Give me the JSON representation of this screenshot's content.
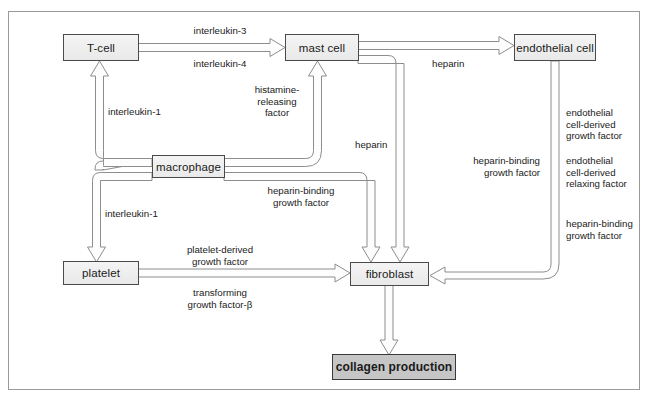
{
  "diagram": {
    "border_color": "#9a9a9a",
    "node_fill": "#eeeeee",
    "goal_fill": "#c6c6c6",
    "line_color": "#8a8a8a"
  },
  "nodes": [
    {
      "id": "tcell",
      "label": "T-cell"
    },
    {
      "id": "mastcell",
      "label": "mast cell"
    },
    {
      "id": "endothelial",
      "label": "endothelial cell"
    },
    {
      "id": "macrophage",
      "label": "macrophage"
    },
    {
      "id": "platelet",
      "label": "platelet"
    },
    {
      "id": "fibroblast",
      "label": "fibroblast"
    },
    {
      "id": "collagen",
      "label": "collagen production"
    }
  ],
  "edge_labels": [
    {
      "id": "il3",
      "text": "interleukin-3"
    },
    {
      "id": "il4",
      "text": "interleukin-4"
    },
    {
      "id": "il1a",
      "text": "interleukin-1"
    },
    {
      "id": "hrf",
      "text": "histamine-\nreleasing\nfactor"
    },
    {
      "id": "hep1",
      "text": "heparin"
    },
    {
      "id": "hep2",
      "text": "heparin"
    },
    {
      "id": "hbgf1",
      "text": "heparin-binding\ngrowth factor"
    },
    {
      "id": "il1b",
      "text": "interleukin-1"
    },
    {
      "id": "pdgf",
      "text": "platelet-derived\ngrowth factor"
    },
    {
      "id": "tgfb",
      "text": "transforming\ngrowth factor-β"
    },
    {
      "id": "hbgf2",
      "text": "heparin-binding\ngrowth factor"
    },
    {
      "id": "ecdgf",
      "text": "endothelial\ncell-derived\ngrowth factor"
    },
    {
      "id": "ecdrf",
      "text": "endothelial\ncell-derived\nrelaxing factor"
    },
    {
      "id": "hbgf3",
      "text": "heparin-binding\ngrowth factor"
    }
  ],
  "edges": [
    {
      "from": "tcell",
      "to": "mastcell",
      "labels": [
        "interleukin-3",
        "interleukin-4"
      ]
    },
    {
      "from": "mastcell",
      "to": "endothelial",
      "labels": [
        "heparin"
      ]
    },
    {
      "from": "macrophage",
      "to": "tcell",
      "labels": [
        "interleukin-1"
      ]
    },
    {
      "from": "macrophage",
      "to": "mastcell",
      "labels": [
        "histamine-releasing factor"
      ]
    },
    {
      "from": "macrophage",
      "to": "platelet",
      "labels": [
        "interleukin-1"
      ]
    },
    {
      "from": "macrophage",
      "to": "fibroblast",
      "labels": [
        "heparin-binding growth factor"
      ]
    },
    {
      "from": "mastcell",
      "to": "fibroblast",
      "labels": [
        "heparin"
      ]
    },
    {
      "from": "platelet",
      "to": "fibroblast",
      "labels": [
        "platelet-derived growth factor",
        "transforming growth factor-β"
      ]
    },
    {
      "from": "endothelial",
      "to": "fibroblast",
      "labels": [
        "heparin-binding growth factor",
        "endothelial cell-derived growth factor",
        "endothelial cell-derived relaxing factor"
      ]
    },
    {
      "from": "fibroblast",
      "to": "collagen",
      "labels": []
    }
  ]
}
